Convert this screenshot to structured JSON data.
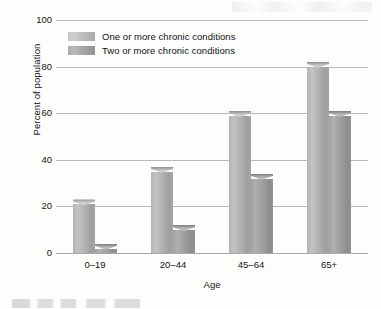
{
  "figure": {
    "name": "chronic-conditions-by-age-bar-chart"
  },
  "axes": {
    "y_title": "Percent of population",
    "x_title": "Age",
    "y_ticks": [
      "100",
      "80",
      "60",
      "40",
      "20",
      "0"
    ]
  },
  "legend": {
    "items": [
      {
        "label": "One or more chronic conditions",
        "color": "#bdbdbb"
      },
      {
        "label": "Two or more chronic conditions",
        "color": "#a3a3a1"
      }
    ]
  },
  "chart_data": {
    "type": "bar",
    "title": "",
    "subtitle": "",
    "xlabel": "Age",
    "ylabel": "Percent of population",
    "categories": [
      "0–19",
      "20–44",
      "45–64",
      "65+"
    ],
    "series": [
      {
        "name": "One or more chronic conditions",
        "values": [
          23,
          37,
          61,
          82
        ]
      },
      {
        "name": "Two or more chronic conditions",
        "values": [
          4,
          12,
          34,
          61
        ]
      }
    ],
    "ylim": [
      0,
      100
    ],
    "ytick_values": [
      0,
      20,
      40,
      60,
      80,
      100
    ],
    "grid": true,
    "legend_position": "top-left-inside"
  }
}
